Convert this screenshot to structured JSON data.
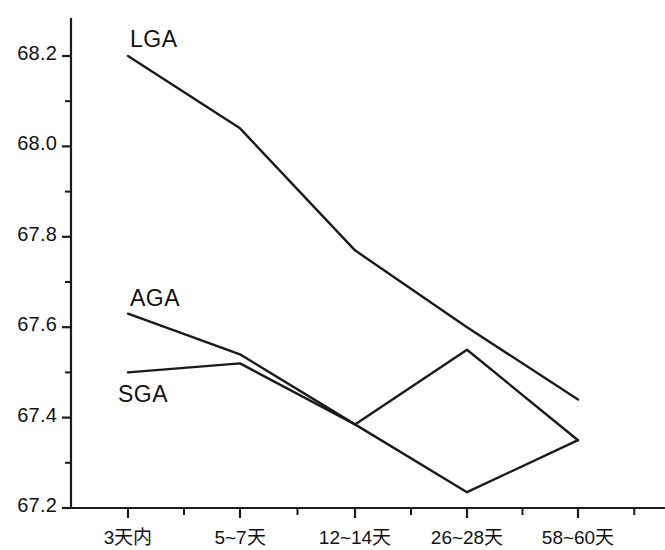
{
  "chart_data": {
    "type": "line",
    "title": "",
    "subtitle": "",
    "xlabel": "",
    "ylabel": "",
    "grid": false,
    "legend_position": "inline-labels",
    "categories": [
      "3天内",
      "5~7天",
      "12~14天",
      "26~28天",
      "58~60天"
    ],
    "ylim": [
      67.2,
      68.2
    ],
    "ytick_labels": [
      "67.2",
      "67.4",
      "67.6",
      "67.8",
      "68.0",
      "68.2"
    ],
    "ytick_values": [
      67.2,
      67.4,
      67.6,
      67.8,
      68.0,
      68.2
    ],
    "yminor_tick_values": [
      67.3,
      67.5,
      67.7,
      67.9,
      68.1
    ],
    "series": [
      {
        "name": "LGA",
        "color": "#1a1a1a",
        "values": [
          68.2,
          68.04,
          67.77,
          67.6,
          67.44
        ],
        "label_x": 130,
        "label_y": 26
      },
      {
        "name": "AGA",
        "color": "#1a1a1a",
        "values": [
          67.63,
          67.54,
          67.385,
          67.55,
          67.35
        ],
        "label_x": 130,
        "label_y": 285
      },
      {
        "name": "SGA",
        "color": "#1a1a1a",
        "values": [
          67.5,
          67.52,
          67.385,
          67.235,
          67.35
        ],
        "label_x": 118,
        "label_y": 381
      }
    ]
  },
  "axes": {
    "origin_x": 71,
    "origin_y": 508,
    "plot_right": 665,
    "plot_top": 18,
    "tick_x_positions": [
      128,
      240,
      355,
      467,
      578
    ],
    "y_top_value": 68.2,
    "y_top_pixel": 56,
    "y_bottom_value": 67.2,
    "y_bottom_pixel": 508,
    "axis_color": "#1a1a1a",
    "line_width": 2.2
  }
}
